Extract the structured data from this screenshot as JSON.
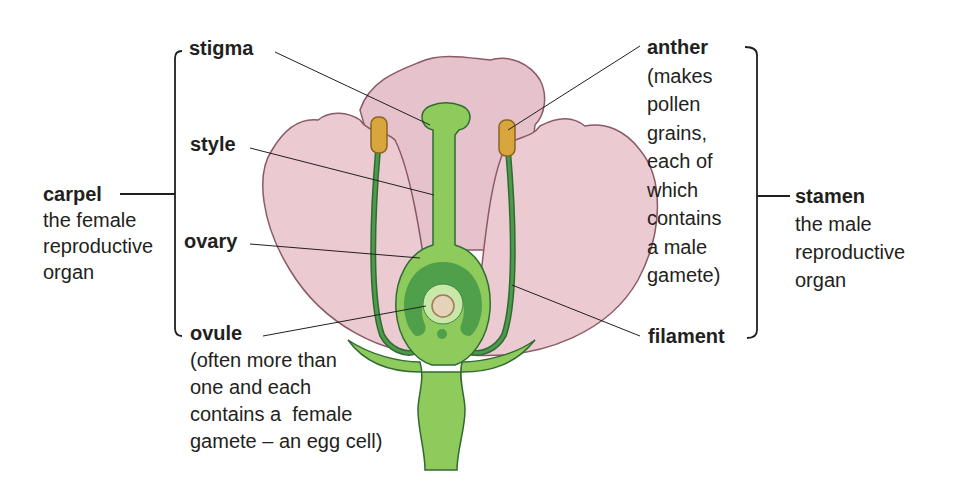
{
  "colors": {
    "petal": "#e9c7cf",
    "petal_edge": "#8a5a66",
    "carpel_green": "#8fca5c",
    "carpel_dark": "#3f8a44",
    "outline": "#2f6b33",
    "anther": "#d9a63e",
    "ovule": "#e6d2b8",
    "text": "#231f20"
  },
  "labels": {
    "stigma": {
      "name": "stigma"
    },
    "style": {
      "name": "style"
    },
    "ovary": {
      "name": "ovary"
    },
    "ovule": {
      "name": "ovule",
      "desc": [
        "(often more than",
        "one and each",
        "contains a  female",
        "gamete – an egg cell)"
      ]
    },
    "carpel": {
      "name": "carpel",
      "desc": [
        "the female",
        "reproductive",
        "organ"
      ]
    },
    "anther": {
      "name": "anther",
      "desc": [
        "(makes",
        "pollen",
        "grains,",
        "each of",
        "which",
        "contains",
        "a male",
        "gamete)"
      ]
    },
    "filament": {
      "name": "filament"
    },
    "stamen": {
      "name": "stamen",
      "desc": [
        "the male",
        "reproductive",
        "organ"
      ]
    }
  }
}
